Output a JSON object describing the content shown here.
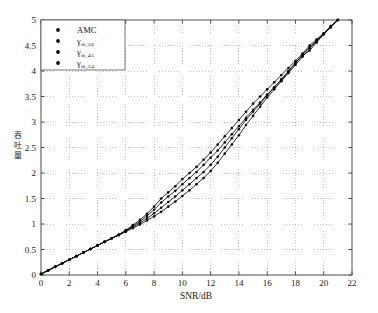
{
  "chart_data": {
    "type": "line",
    "title": "",
    "subtitle": "",
    "xlabel": "SNR/dB",
    "ylabel": "吞吐量",
    "ylabel_chars": [
      "吞",
      "吐",
      "量"
    ],
    "xlim": [
      0,
      22
    ],
    "ylim": [
      0,
      5
    ],
    "xticks": [
      0,
      2,
      4,
      6,
      8,
      10,
      12,
      14,
      16,
      18,
      20,
      22
    ],
    "xticklabels": [
      "0",
      "2",
      "4",
      "6",
      "8",
      "10",
      "12",
      "14",
      "16",
      "18",
      "20",
      "22"
    ],
    "yticks": [
      0,
      0.5,
      1,
      1.5,
      2,
      2.5,
      3,
      3.5,
      4,
      4.5,
      5
    ],
    "yticklabels": [
      "0",
      "0.5",
      "1",
      "1.5",
      "2",
      "2.5",
      "3",
      "3.5",
      "4",
      "4.5",
      "5"
    ],
    "grid": true,
    "grid_style": "dotted",
    "grid_color": "#9a9a9a",
    "legend_position": "upper left",
    "marker": "filled-circle",
    "line_color": "#0b0b0b",
    "x": [
      0,
      0.5,
      1,
      1.5,
      2,
      2.5,
      3,
      3.5,
      4,
      4.5,
      5,
      5.5,
      6,
      6.5,
      7,
      7.5,
      8,
      8.5,
      9,
      9.5,
      10,
      10.5,
      11,
      11.5,
      12,
      12.5,
      13,
      13.5,
      14,
      14.5,
      15,
      15.5,
      16,
      16.5,
      17,
      17.5,
      18,
      18.5,
      19,
      19.5,
      20,
      20.5,
      21
    ],
    "series": [
      {
        "name": "AMC",
        "label": "AMC",
        "values": [
          0.02,
          0.09,
          0.16,
          0.23,
          0.3,
          0.37,
          0.44,
          0.51,
          0.58,
          0.65,
          0.72,
          0.79,
          0.88,
          0.98,
          1.08,
          1.2,
          1.34,
          1.5,
          1.62,
          1.74,
          1.88,
          2.0,
          2.12,
          2.26,
          2.4,
          2.56,
          2.72,
          2.88,
          3.04,
          3.2,
          3.36,
          3.5,
          3.64,
          3.78,
          3.92,
          4.06,
          4.2,
          4.34,
          4.5,
          4.62,
          4.74,
          4.88,
          5.0
        ]
      },
      {
        "name": "gamma_th_5_6",
        "label": "γ",
        "label_sub": "th_5/6",
        "values": [
          0.02,
          0.09,
          0.16,
          0.23,
          0.3,
          0.37,
          0.44,
          0.51,
          0.58,
          0.65,
          0.72,
          0.79,
          0.87,
          0.96,
          1.05,
          1.16,
          1.28,
          1.42,
          1.54,
          1.65,
          1.78,
          1.9,
          2.02,
          2.16,
          2.3,
          2.44,
          2.6,
          2.76,
          2.92,
          3.08,
          3.24,
          3.38,
          3.54,
          3.68,
          3.82,
          3.98,
          4.16,
          4.3,
          4.4,
          4.56,
          4.72,
          4.86,
          5.0
        ]
      },
      {
        "name": "gamma_th_4_5",
        "label": "γ",
        "label_sub": "th_4/5",
        "values": [
          0.02,
          0.09,
          0.16,
          0.23,
          0.3,
          0.37,
          0.44,
          0.51,
          0.58,
          0.65,
          0.72,
          0.79,
          0.86,
          0.94,
          1.02,
          1.11,
          1.21,
          1.32,
          1.43,
          1.54,
          1.66,
          1.78,
          1.9,
          2.02,
          2.16,
          2.32,
          2.5,
          2.68,
          2.86,
          3.04,
          3.2,
          3.36,
          3.52,
          3.68,
          3.84,
          4.0,
          4.16,
          4.32,
          4.46,
          4.6,
          4.74,
          4.88,
          5.0
        ]
      },
      {
        "name": "gamma_th_3_4",
        "label": "γ",
        "label_sub": "th_3/4",
        "values": [
          0.02,
          0.09,
          0.16,
          0.23,
          0.3,
          0.37,
          0.44,
          0.51,
          0.58,
          0.65,
          0.72,
          0.78,
          0.85,
          0.92,
          0.99,
          1.07,
          1.15,
          1.24,
          1.34,
          1.44,
          1.55,
          1.66,
          1.78,
          1.9,
          2.04,
          2.2,
          2.38,
          2.56,
          2.74,
          2.94,
          3.12,
          3.3,
          3.48,
          3.64,
          3.8,
          3.96,
          4.12,
          4.28,
          4.44,
          4.58,
          4.72,
          4.86,
          5.0
        ]
      }
    ],
    "legend_entries": [
      {
        "label": "AMC",
        "sub": "",
        "marker": "filled-circle"
      },
      {
        "label": "γ",
        "sub": "th_5/6",
        "marker": "filled-circle"
      },
      {
        "label": "γ",
        "sub": "th_4/5",
        "marker": "filled-circle"
      },
      {
        "label": "γ",
        "sub": "th_3/4",
        "marker": "filled-circle"
      }
    ]
  }
}
